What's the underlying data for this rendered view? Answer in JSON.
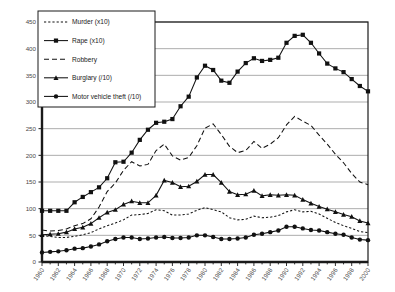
{
  "chart_data": {
    "type": "line",
    "title": "",
    "xlabel": "",
    "ylabel": "",
    "xlim": [
      1960,
      2000
    ],
    "ylim": [
      0,
      450
    ],
    "ytick_step": 50,
    "xtick_step": 2,
    "grid": true,
    "legend_position": "top-left",
    "yticks": [
      0,
      50,
      100,
      150,
      200,
      250,
      300,
      350,
      400,
      450
    ],
    "xticks": [
      1960,
      1962,
      1964,
      1966,
      1968,
      1970,
      1972,
      1974,
      1976,
      1978,
      1980,
      1982,
      1984,
      1986,
      1988,
      1990,
      1992,
      1994,
      1996,
      1998,
      2000
    ],
    "x": [
      1960,
      1961,
      1962,
      1963,
      1964,
      1965,
      1966,
      1967,
      1968,
      1969,
      1970,
      1971,
      1972,
      1973,
      1974,
      1975,
      1976,
      1977,
      1978,
      1979,
      1980,
      1981,
      1982,
      1983,
      1984,
      1985,
      1986,
      1987,
      1988,
      1989,
      1990,
      1991,
      1992,
      1993,
      1994,
      1995,
      1996,
      1997,
      1998,
      1999,
      2000
    ],
    "series": [
      {
        "name": "Murder (x10)",
        "label": "Murder  (x10)",
        "marker": "none",
        "dash": "dotted",
        "values": [
          50,
          48,
          46,
          46,
          48,
          51,
          55,
          62,
          68,
          73,
          79,
          88,
          89,
          91,
          98,
          96,
          88,
          88,
          90,
          97,
          102,
          98,
          94,
          83,
          79,
          80,
          86,
          83,
          84,
          87,
          94,
          98,
          94,
          95,
          90,
          82,
          74,
          68,
          63,
          57,
          55
        ]
      },
      {
        "name": "Rape (x10)",
        "label": "Rape  (x10)",
        "marker": "square",
        "dash": "solid",
        "values": [
          96,
          96,
          96,
          96,
          112,
          122,
          131,
          140,
          157,
          187,
          188,
          205,
          229,
          248,
          261,
          263,
          268,
          292,
          310,
          346,
          368,
          360,
          340,
          336,
          357,
          373,
          382,
          377,
          379,
          383,
          411,
          424,
          426,
          411,
          391,
          372,
          363,
          356,
          343,
          330,
          320
        ]
      },
      {
        "name": "Robbery",
        "label": "Robbery",
        "marker": "none",
        "dash": "dashed",
        "values": [
          60,
          58,
          59,
          62,
          68,
          72,
          81,
          103,
          132,
          148,
          172,
          188,
          180,
          183,
          209,
          221,
          199,
          191,
          196,
          218,
          251,
          259,
          239,
          217,
          205,
          209,
          226,
          213,
          221,
          233,
          257,
          273,
          264,
          256,
          238,
          221,
          202,
          186,
          166,
          150,
          145
        ]
      },
      {
        "name": "Burglary (/10)",
        "label": "Burglary  (/10)",
        "marker": "triangle",
        "dash": "solid",
        "values": [
          51,
          52,
          53,
          56,
          62,
          65,
          72,
          83,
          93,
          98,
          108,
          114,
          111,
          111,
          125,
          153,
          149,
          141,
          142,
          151,
          164,
          164,
          149,
          132,
          126,
          127,
          134,
          124,
          126,
          125,
          126,
          125,
          117,
          110,
          104,
          99,
          94,
          89,
          85,
          77,
          73
        ]
      },
      {
        "name": "Motor vehicle theft (/10)",
        "label": "Motor  vehicle  theft  (/10)",
        "marker": "circle",
        "dash": "solid",
        "values": [
          18,
          19,
          20,
          22,
          25,
          26,
          29,
          33,
          39,
          43,
          46,
          46,
          43,
          44,
          46,
          47,
          45,
          45,
          46,
          50,
          50,
          47,
          43,
          43,
          44,
          46,
          51,
          53,
          56,
          59,
          66,
          66,
          63,
          60,
          59,
          56,
          53,
          51,
          46,
          42,
          41
        ]
      }
    ]
  },
  "legend": {
    "items": [
      {
        "label": "Murder  (x10)"
      },
      {
        "label": "Rape  (x10)"
      },
      {
        "label": "Robbery"
      },
      {
        "label": "Burglary  (/10)"
      },
      {
        "label": "Motor  vehicle  theft  (/10)"
      }
    ]
  },
  "colors": {
    "axis": "#1a1a1a",
    "grid": "#8a8a8a",
    "series": "#111111",
    "tick_label": "#4a4a4a",
    "background": "#ffffff"
  }
}
